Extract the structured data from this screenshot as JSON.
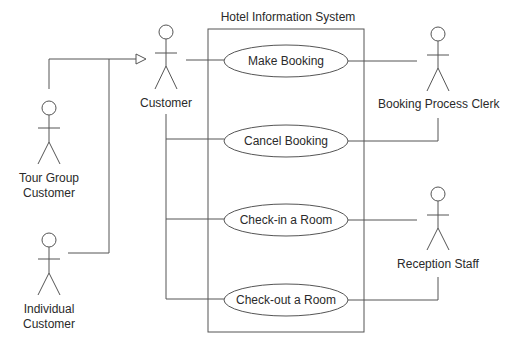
{
  "diagram": {
    "type": "uml-use-case",
    "system": {
      "title": "Hotel Information System",
      "box": {
        "x": 208,
        "y": 29,
        "w": 156,
        "h": 303
      }
    },
    "use_cases": [
      {
        "id": "make_booking",
        "label": "Make Booking",
        "cx": 286,
        "cy": 61,
        "rx": 62,
        "ry": 16
      },
      {
        "id": "cancel_booking",
        "label": "Cancel Booking",
        "cx": 286,
        "cy": 141,
        "rx": 62,
        "ry": 16
      },
      {
        "id": "check_in",
        "label": "Check-in a Room",
        "cx": 286,
        "cy": 220,
        "rx": 62,
        "ry": 16
      },
      {
        "id": "check_out",
        "label": "Check-out a Room",
        "cx": 286,
        "cy": 300,
        "rx": 62,
        "ry": 16
      }
    ],
    "actors": [
      {
        "id": "customer",
        "label": "Customer",
        "x": 166,
        "y": 25
      },
      {
        "id": "tour_group",
        "label": "Tour Group Customer",
        "label_lines": [
          "Tour Group",
          "Customer"
        ],
        "x": 49,
        "y": 100
      },
      {
        "id": "individual",
        "label": "Individual Customer",
        "label_lines": [
          "Individual",
          "Customer"
        ],
        "x": 49,
        "y": 232
      },
      {
        "id": "clerk",
        "label": "Booking Process Clerk",
        "x": 438,
        "y": 25
      },
      {
        "id": "reception",
        "label": "Reception Staff",
        "x": 438,
        "y": 185
      }
    ],
    "associations": [
      {
        "from": "customer",
        "to": "make_booking"
      },
      {
        "from": "customer",
        "to": "cancel_booking"
      },
      {
        "from": "customer",
        "to": "check_in"
      },
      {
        "from": "customer",
        "to": "check_out"
      },
      {
        "from": "clerk",
        "to": "make_booking"
      },
      {
        "from": "clerk",
        "to": "cancel_booking"
      },
      {
        "from": "reception",
        "to": "check_in"
      },
      {
        "from": "reception",
        "to": "check_out"
      }
    ],
    "generalizations": [
      {
        "child": "tour_group",
        "parent": "customer"
      },
      {
        "child": "individual",
        "parent": "customer"
      }
    ],
    "colors": {
      "stroke": "#555555",
      "text": "#2a2a2a",
      "background": "#ffffff"
    }
  }
}
